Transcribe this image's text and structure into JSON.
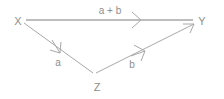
{
  "diagram": {
    "type": "vector-triangle",
    "background_color": "#ffffff",
    "line_color": "#a8a8a8",
    "text_color": "#8e8e8e",
    "vertices": [
      {
        "id": "X",
        "label": "X",
        "x": 18,
        "y": 21
      },
      {
        "id": "Y",
        "label": "Y",
        "x": 200,
        "y": 21
      },
      {
        "id": "Z",
        "label": "Z",
        "x": 97,
        "y": 87
      }
    ],
    "edges": [
      {
        "id": "x-to-y",
        "from": "X",
        "to": "Y",
        "label": "a + b",
        "label_x": 110,
        "label_y": 14,
        "x1": 26,
        "y1": 20,
        "x2": 193,
        "y2": 20,
        "arrow_position": "mid"
      },
      {
        "id": "x-to-z",
        "from": "X",
        "to": "Z",
        "label": "a",
        "label_x": 58,
        "label_y": 66,
        "x1": 24,
        "y1": 23,
        "x2": 93,
        "y2": 73,
        "arrow_position": "mid"
      },
      {
        "id": "z-to-y",
        "from": "Z",
        "to": "Y",
        "label": "b",
        "label_x": 132,
        "label_y": 68,
        "x1": 96,
        "y1": 73,
        "x2": 194,
        "y2": 24,
        "arrow_position": "end"
      }
    ]
  }
}
